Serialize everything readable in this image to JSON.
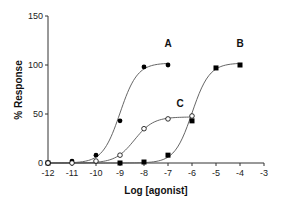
{
  "chart_data": {
    "type": "scatter",
    "title": "",
    "xlabel": "Log [agonist]",
    "ylabel": "% Response",
    "xlim": [
      -12,
      -3
    ],
    "ylim": [
      0,
      150
    ],
    "xticks": [
      -12,
      -11,
      -10,
      -9,
      -8,
      -7,
      -6,
      -5,
      -4,
      -3
    ],
    "yticks": [
      0,
      50,
      100,
      150
    ],
    "xtick_labels": [
      "-12",
      "-11",
      "-10",
      "-9",
      "-8",
      "-7",
      "-6",
      "-5",
      "-4",
      "-3"
    ],
    "ytick_labels": [
      "0",
      "50",
      "100",
      "150"
    ],
    "grid": false,
    "legend": "none",
    "series": [
      {
        "name": "A",
        "marker": "filled-circle",
        "x": [
          -12,
          -11,
          -10,
          -9,
          -8,
          -7
        ],
        "y": [
          0,
          2,
          8,
          43,
          98,
          100
        ],
        "fit": {
          "bottom": 0,
          "top": 102,
          "logEC50": -9.0,
          "hill": 1.2
        },
        "label_at": {
          "x": -7,
          "y": 118
        }
      },
      {
        "name": "B",
        "marker": "filled-square",
        "x": [
          -12,
          -9,
          -8,
          -7,
          -6,
          -5,
          -4
        ],
        "y": [
          0,
          0,
          1,
          8,
          43,
          97,
          100
        ],
        "fit": {
          "bottom": 0,
          "top": 102,
          "logEC50": -6.0,
          "hill": 1.2
        },
        "label_at": {
          "x": -4,
          "y": 118
        }
      },
      {
        "name": "C",
        "marker": "open-circle",
        "x": [
          -12,
          -11,
          -10,
          -9,
          -8,
          -7,
          -6
        ],
        "y": [
          0,
          0,
          2,
          8,
          35,
          45,
          48
        ],
        "fit": {
          "bottom": 0,
          "top": 47,
          "logEC50": -8.4,
          "hill": 1.1
        },
        "label_at": {
          "x": -6.5,
          "y": 57
        }
      }
    ]
  }
}
